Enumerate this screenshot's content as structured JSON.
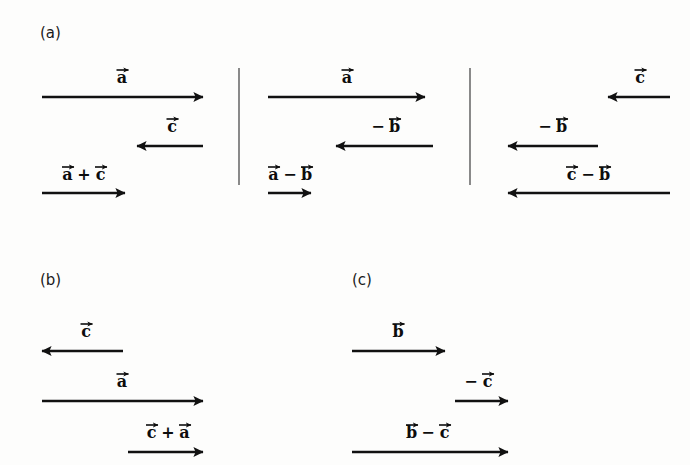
{
  "figure": {
    "width": 690,
    "height": 465,
    "background_color": "#fdfdfc",
    "ink_color": "#111111"
  },
  "panels": [
    {
      "id": "a",
      "label": "(a)",
      "label_x": 40,
      "label_y": 38,
      "subpanels": [
        {
          "id": "a1",
          "vectors": [
            {
              "name": "a-vector",
              "label": "a",
              "label_parts": [
                {
                  "text": "a",
                  "arrow": true
                }
              ],
              "x1": 42,
              "x2": 203,
              "y": 97,
              "direction": "right",
              "label_x": 122,
              "label_y": 83
            },
            {
              "name": "c-vector",
              "label": "c",
              "label_parts": [
                {
                  "text": "c",
                  "arrow": true
                }
              ],
              "x1": 203,
              "x2": 137,
              "y": 146,
              "direction": "left",
              "label_x": 172,
              "label_y": 132
            },
            {
              "name": "a-plus-c-vector",
              "label": "a + c",
              "label_parts": [
                {
                  "text": "a",
                  "arrow": true
                },
                {
                  "text": "+",
                  "arrow": false
                },
                {
                  "text": "c",
                  "arrow": true
                }
              ],
              "x1": 42,
              "x2": 125,
              "y": 193,
              "direction": "right",
              "label_x": 84,
              "label_y": 180
            }
          ]
        },
        {
          "id": "a2",
          "vectors": [
            {
              "name": "a-vector",
              "label": "a",
              "label_parts": [
                {
                  "text": "a",
                  "arrow": true
                }
              ],
              "x1": 268,
              "x2": 425,
              "y": 97,
              "direction": "right",
              "label_x": 347,
              "label_y": 83
            },
            {
              "name": "minus-b-vector",
              "label": "-b",
              "label_parts": [
                {
                  "text": "−",
                  "arrow": false
                },
                {
                  "text": "b",
                  "arrow": true
                }
              ],
              "x1": 433,
              "x2": 336,
              "y": 146,
              "direction": "left",
              "label_x": 385,
              "label_y": 132
            },
            {
              "name": "a-minus-b-vector",
              "label": "a - b",
              "label_parts": [
                {
                  "text": "a",
                  "arrow": true
                },
                {
                  "text": "−",
                  "arrow": false
                },
                {
                  "text": "b",
                  "arrow": true
                }
              ],
              "x1": 268,
              "x2": 311,
              "y": 193,
              "direction": "right",
              "label_x": 290,
              "label_y": 180
            }
          ]
        },
        {
          "id": "a3",
          "vectors": [
            {
              "name": "c-vector",
              "label": "c",
              "label_parts": [
                {
                  "text": "c",
                  "arrow": true
                }
              ],
              "x1": 670,
              "x2": 608,
              "y": 97,
              "direction": "left",
              "label_x": 640,
              "label_y": 83
            },
            {
              "name": "minus-b-vector",
              "label": "-b",
              "label_parts": [
                {
                  "text": "−",
                  "arrow": false
                },
                {
                  "text": "b",
                  "arrow": true
                }
              ],
              "x1": 598,
              "x2": 508,
              "y": 146,
              "direction": "left",
              "label_x": 552,
              "label_y": 132
            },
            {
              "name": "c-minus-b-vector",
              "label": "c - b",
              "label_parts": [
                {
                  "text": "c",
                  "arrow": true
                },
                {
                  "text": "−",
                  "arrow": false
                },
                {
                  "text": "b",
                  "arrow": true
                }
              ],
              "x1": 670,
              "x2": 508,
              "y": 193,
              "direction": "left",
              "label_x": 588,
              "label_y": 180
            }
          ]
        }
      ],
      "dividers": [
        {
          "name": "panel-divider-1",
          "x": 239,
          "y1": 68,
          "y2": 185
        },
        {
          "name": "panel-divider-2",
          "x": 470,
          "y1": 68,
          "y2": 185
        }
      ]
    },
    {
      "id": "b",
      "label": "(b)",
      "label_x": 40,
      "label_y": 285,
      "subpanels": [
        {
          "id": "b1",
          "vectors": [
            {
              "name": "c-vector",
              "label": "c",
              "label_parts": [
                {
                  "text": "c",
                  "arrow": true
                }
              ],
              "x1": 123,
              "x2": 42,
              "y": 351,
              "direction": "left",
              "label_x": 86,
              "label_y": 337
            },
            {
              "name": "a-vector",
              "label": "a",
              "label_parts": [
                {
                  "text": "a",
                  "arrow": true
                }
              ],
              "x1": 42,
              "x2": 203,
              "y": 401,
              "direction": "right",
              "label_x": 122,
              "label_y": 387
            },
            {
              "name": "c-plus-a-vector",
              "label": "c + a",
              "label_parts": [
                {
                  "text": "c",
                  "arrow": true
                },
                {
                  "text": "+",
                  "arrow": false
                },
                {
                  "text": "a",
                  "arrow": true
                }
              ],
              "x1": 128,
              "x2": 203,
              "y": 452,
              "direction": "right",
              "label_x": 168,
              "label_y": 438
            }
          ]
        }
      ],
      "dividers": []
    },
    {
      "id": "c",
      "label": "(c)",
      "label_x": 352,
      "label_y": 285,
      "subpanels": [
        {
          "id": "c1",
          "vectors": [
            {
              "name": "b-vector",
              "label": "b",
              "label_parts": [
                {
                  "text": "b",
                  "arrow": true
                }
              ],
              "x1": 352,
              "x2": 445,
              "y": 351,
              "direction": "right",
              "label_x": 398,
              "label_y": 337
            },
            {
              "name": "minus-c-vector",
              "label": "-c",
              "label_parts": [
                {
                  "text": "−",
                  "arrow": false
                },
                {
                  "text": "c",
                  "arrow": true
                }
              ],
              "x1": 455,
              "x2": 508,
              "y": 401,
              "direction": "right",
              "label_x": 478,
              "label_y": 387
            },
            {
              "name": "b-minus-c-vector",
              "label": "b - c",
              "label_parts": [
                {
                  "text": "b",
                  "arrow": true
                },
                {
                  "text": "−",
                  "arrow": false
                },
                {
                  "text": "c",
                  "arrow": true
                }
              ],
              "x1": 352,
              "x2": 508,
              "y": 452,
              "direction": "right",
              "label_x": 428,
              "label_y": 438
            }
          ]
        }
      ],
      "dividers": []
    }
  ]
}
